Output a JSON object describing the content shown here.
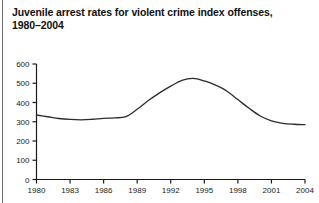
{
  "figure": {
    "title_line1": "Juvenile arrest rates for violent crime index offenses,",
    "title_line2": "1980–2004",
    "background_color": "#ffffff",
    "line_color": "#2b2b2b",
    "axis_color": "#1a1a1a",
    "rule_color": "#6b6b6b"
  },
  "chart_data": {
    "type": "line",
    "title": "Juvenile arrest rates for violent crime index offenses, 1980–2004",
    "xlabel": "",
    "ylabel": "",
    "xlim": [
      1980,
      2004
    ],
    "ylim": [
      0,
      600
    ],
    "grid": false,
    "legend": null,
    "ytick_labels": [
      "0",
      "100",
      "200",
      "300",
      "400",
      "500",
      "600"
    ],
    "ytick_values": [
      0,
      100,
      200,
      300,
      400,
      500,
      600
    ],
    "xtick_labels": [
      "1980",
      "1983",
      "1986",
      "1989",
      "1992",
      "1995",
      "1998",
      "2001",
      "2004"
    ],
    "xtick_values": [
      1980,
      1983,
      1986,
      1989,
      1992,
      1995,
      1998,
      2001,
      2004
    ],
    "series": [
      {
        "name": "Juvenile violent crime index arrest rate",
        "x": [
          1980,
          1981,
          1982,
          1983,
          1984,
          1985,
          1986,
          1987,
          1988,
          1989,
          1990,
          1991,
          1992,
          1993,
          1994,
          1995,
          1996,
          1997,
          1998,
          1999,
          2000,
          2001,
          2002,
          2003,
          2004
        ],
        "values": [
          335,
          326,
          317,
          312,
          310,
          313,
          318,
          320,
          327,
          365,
          410,
          450,
          485,
          515,
          525,
          512,
          490,
          460,
          415,
          370,
          330,
          305,
          292,
          287,
          285
        ]
      }
    ]
  }
}
